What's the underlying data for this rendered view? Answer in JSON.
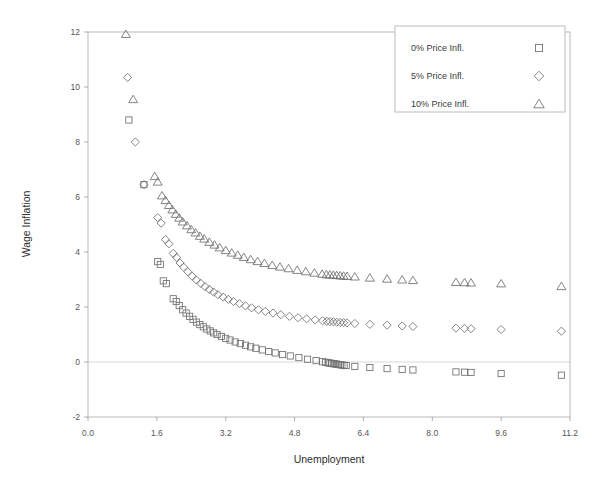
{
  "chart_data": {
    "type": "scatter",
    "title": "",
    "xlabel": "Unemployment",
    "ylabel": "Wage Inflation",
    "xlim": [
      0.0,
      11.2
    ],
    "ylim": [
      -2,
      12
    ],
    "xticks": [
      "0.0",
      "1.6",
      "3.2",
      "4.8",
      "6.4",
      "8.0",
      "9.6",
      "11.2"
    ],
    "xtick_values": [
      0.0,
      1.6,
      3.2,
      4.8,
      6.4,
      8.0,
      9.6,
      11.2
    ],
    "yticks": [
      "-2",
      "0",
      "2",
      "4",
      "6",
      "8",
      "10",
      "12"
    ],
    "ytick_values": [
      -2,
      0,
      2,
      4,
      6,
      8,
      10,
      12
    ],
    "grid": "horizontal-zero-line-only",
    "legend_position": "top-right",
    "series": [
      {
        "name": "0% Price Infl.",
        "marker": "square",
        "points": [
          [
            0.95,
            8.8
          ],
          [
            1.3,
            6.45
          ],
          [
            1.62,
            3.65
          ],
          [
            1.68,
            3.55
          ],
          [
            1.75,
            2.95
          ],
          [
            1.82,
            2.85
          ],
          [
            1.98,
            2.3
          ],
          [
            2.05,
            2.2
          ],
          [
            2.12,
            2.05
          ],
          [
            2.2,
            1.9
          ],
          [
            2.28,
            1.78
          ],
          [
            2.36,
            1.66
          ],
          [
            2.44,
            1.55
          ],
          [
            2.52,
            1.45
          ],
          [
            2.6,
            1.36
          ],
          [
            2.68,
            1.28
          ],
          [
            2.76,
            1.2
          ],
          [
            2.84,
            1.13
          ],
          [
            2.92,
            1.06
          ],
          [
            3.0,
            1.0
          ],
          [
            3.1,
            0.93
          ],
          [
            3.2,
            0.86
          ],
          [
            3.3,
            0.8
          ],
          [
            3.42,
            0.73
          ],
          [
            3.54,
            0.67
          ],
          [
            3.66,
            0.61
          ],
          [
            3.78,
            0.55
          ],
          [
            3.9,
            0.5
          ],
          [
            4.05,
            0.44
          ],
          [
            4.2,
            0.38
          ],
          [
            4.35,
            0.33
          ],
          [
            4.52,
            0.27
          ],
          [
            4.7,
            0.22
          ],
          [
            4.9,
            0.16
          ],
          [
            5.1,
            0.1
          ],
          [
            5.3,
            0.05
          ],
          [
            5.45,
            0.01
          ],
          [
            5.52,
            -0.01
          ],
          [
            5.58,
            -0.03
          ],
          [
            5.62,
            -0.04
          ],
          [
            5.66,
            -0.05
          ],
          [
            5.7,
            -0.06
          ],
          [
            5.74,
            -0.07
          ],
          [
            5.78,
            -0.08
          ],
          [
            5.82,
            -0.09
          ],
          [
            5.86,
            -0.1
          ],
          [
            5.9,
            -0.11
          ],
          [
            5.95,
            -0.12
          ],
          [
            6.0,
            -0.13
          ],
          [
            6.2,
            -0.16
          ],
          [
            6.55,
            -0.2
          ],
          [
            6.95,
            -0.24
          ],
          [
            7.3,
            -0.27
          ],
          [
            7.55,
            -0.29
          ],
          [
            8.55,
            -0.36
          ],
          [
            8.75,
            -0.37
          ],
          [
            8.9,
            -0.38
          ],
          [
            9.6,
            -0.42
          ],
          [
            11.0,
            -0.48
          ]
        ]
      },
      {
        "name": "5% Price Infl.",
        "marker": "diamond",
        "points": [
          [
            0.92,
            10.35
          ],
          [
            1.1,
            8.0
          ],
          [
            1.3,
            6.45
          ],
          [
            1.62,
            5.25
          ],
          [
            1.7,
            5.05
          ],
          [
            1.8,
            4.45
          ],
          [
            1.88,
            4.3
          ],
          [
            1.98,
            3.95
          ],
          [
            2.06,
            3.8
          ],
          [
            2.14,
            3.6
          ],
          [
            2.22,
            3.45
          ],
          [
            2.32,
            3.28
          ],
          [
            2.42,
            3.12
          ],
          [
            2.52,
            2.98
          ],
          [
            2.62,
            2.86
          ],
          [
            2.72,
            2.74
          ],
          [
            2.82,
            2.64
          ],
          [
            2.92,
            2.54
          ],
          [
            3.02,
            2.45
          ],
          [
            3.14,
            2.36
          ],
          [
            3.26,
            2.28
          ],
          [
            3.38,
            2.2
          ],
          [
            3.52,
            2.12
          ],
          [
            3.66,
            2.04
          ],
          [
            3.8,
            1.97
          ],
          [
            3.96,
            1.9
          ],
          [
            4.12,
            1.84
          ],
          [
            4.3,
            1.78
          ],
          [
            4.48,
            1.72
          ],
          [
            4.68,
            1.66
          ],
          [
            4.88,
            1.61
          ],
          [
            5.08,
            1.57
          ],
          [
            5.28,
            1.53
          ],
          [
            5.45,
            1.5
          ],
          [
            5.55,
            1.48
          ],
          [
            5.62,
            1.47
          ],
          [
            5.7,
            1.46
          ],
          [
            5.78,
            1.45
          ],
          [
            5.86,
            1.44
          ],
          [
            5.94,
            1.43
          ],
          [
            6.02,
            1.42
          ],
          [
            6.2,
            1.4
          ],
          [
            6.55,
            1.37
          ],
          [
            6.95,
            1.34
          ],
          [
            7.3,
            1.31
          ],
          [
            7.55,
            1.29
          ],
          [
            8.55,
            1.23
          ],
          [
            8.75,
            1.22
          ],
          [
            8.9,
            1.21
          ],
          [
            9.6,
            1.18
          ],
          [
            11.0,
            1.12
          ]
        ]
      },
      {
        "name": "10% Price Infl.",
        "marker": "triangle",
        "points": [
          [
            0.88,
            11.92
          ],
          [
            1.05,
            9.55
          ],
          [
            1.55,
            6.75
          ],
          [
            1.62,
            6.55
          ],
          [
            1.72,
            6.05
          ],
          [
            1.8,
            5.88
          ],
          [
            1.88,
            5.7
          ],
          [
            1.96,
            5.54
          ],
          [
            2.04,
            5.38
          ],
          [
            2.12,
            5.24
          ],
          [
            2.2,
            5.1
          ],
          [
            2.3,
            4.96
          ],
          [
            2.4,
            4.82
          ],
          [
            2.5,
            4.7
          ],
          [
            2.6,
            4.58
          ],
          [
            2.7,
            4.48
          ],
          [
            2.82,
            4.36
          ],
          [
            2.94,
            4.26
          ],
          [
            3.06,
            4.16
          ],
          [
            3.2,
            4.06
          ],
          [
            3.34,
            3.97
          ],
          [
            3.48,
            3.89
          ],
          [
            3.62,
            3.81
          ],
          [
            3.78,
            3.73
          ],
          [
            3.94,
            3.66
          ],
          [
            4.1,
            3.59
          ],
          [
            4.28,
            3.52
          ],
          [
            4.46,
            3.46
          ],
          [
            4.66,
            3.4
          ],
          [
            4.86,
            3.34
          ],
          [
            5.06,
            3.29
          ],
          [
            5.26,
            3.24
          ],
          [
            5.44,
            3.2
          ],
          [
            5.54,
            3.18
          ],
          [
            5.62,
            3.17
          ],
          [
            5.7,
            3.16
          ],
          [
            5.78,
            3.15
          ],
          [
            5.86,
            3.14
          ],
          [
            5.94,
            3.13
          ],
          [
            6.02,
            3.12
          ],
          [
            6.2,
            3.1
          ],
          [
            6.55,
            3.06
          ],
          [
            6.95,
            3.02
          ],
          [
            7.3,
            2.99
          ],
          [
            7.55,
            2.97
          ],
          [
            8.55,
            2.9
          ],
          [
            8.75,
            2.89
          ],
          [
            8.9,
            2.88
          ],
          [
            9.6,
            2.85
          ],
          [
            11.0,
            2.75
          ]
        ]
      }
    ]
  },
  "legend": {
    "entries": [
      {
        "label": "0% Price Infl.",
        "marker": "square"
      },
      {
        "label": "5% Price Infl.",
        "marker": "diamond"
      },
      {
        "label": "10% Price Infl.",
        "marker": "triangle"
      }
    ]
  },
  "colors": {
    "marker_stroke": "#6f6f6f",
    "frame": "#b9b9b9",
    "grid": "#cfcfcf",
    "text": "#3a3a3a",
    "background": "#ffffff"
  }
}
